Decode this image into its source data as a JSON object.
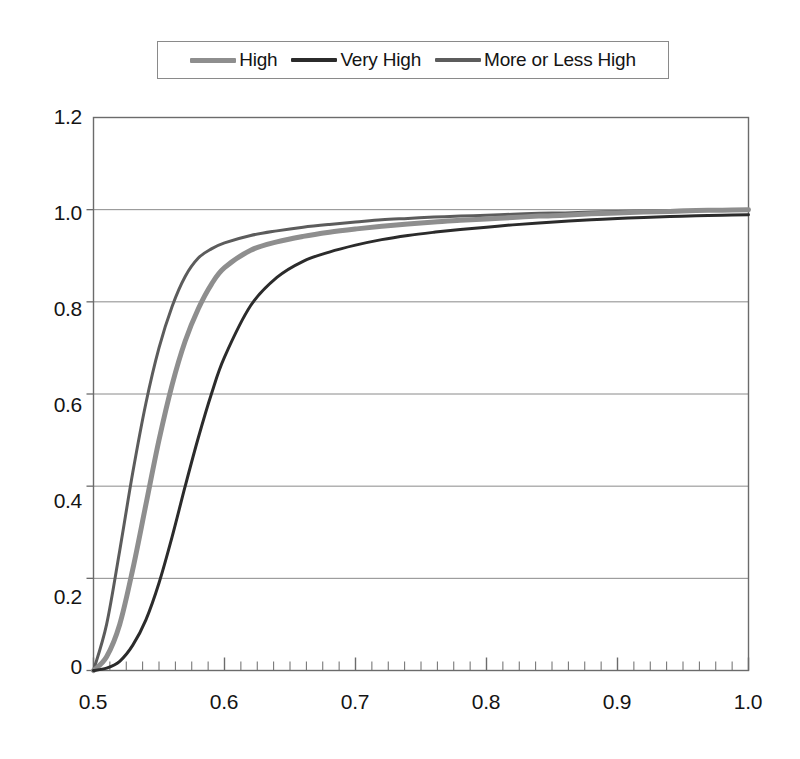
{
  "chart_data": {
    "type": "line",
    "title": "",
    "subtitle": "",
    "xlabel": "",
    "ylabel": "",
    "xlim": [
      0.5,
      1.0
    ],
    "ylim": [
      0,
      1.2
    ],
    "xticks": [
      "0.5",
      "0.6",
      "0.7",
      "0.8",
      "0.9",
      "1.0"
    ],
    "xtick_values": [
      0.5,
      0.6,
      0.7,
      0.8,
      0.9,
      1.0
    ],
    "yticks": [
      "0",
      "0.2",
      "0.4",
      "0.6",
      "0.8",
      "1.0",
      "1.2"
    ],
    "ytick_values": [
      0,
      0.2,
      0.4,
      0.6,
      0.8,
      1.0,
      1.2
    ],
    "grid": "horizontal",
    "x_minor_ticks": true,
    "x_minor_tick_step": 0.0125,
    "legend_position": "top-center",
    "legend_border": true,
    "x": [
      0.5,
      0.51,
      0.52,
      0.53,
      0.54,
      0.55,
      0.56,
      0.57,
      0.58,
      0.59,
      0.6,
      0.62,
      0.64,
      0.66,
      0.68,
      0.7,
      0.72,
      0.74,
      0.76,
      0.78,
      0.8,
      0.82,
      0.84,
      0.86,
      0.88,
      0.9,
      0.92,
      0.94,
      0.96,
      0.98,
      1.0
    ],
    "series": [
      {
        "name": "More or Less High",
        "color": "#5c5c5c",
        "line_width": 3,
        "values": [
          0.0,
          0.1,
          0.26,
          0.43,
          0.58,
          0.7,
          0.79,
          0.855,
          0.895,
          0.915,
          0.928,
          0.944,
          0.954,
          0.962,
          0.968,
          0.973,
          0.978,
          0.981,
          0.984,
          0.986,
          0.988,
          0.99,
          0.992,
          0.993,
          0.995,
          0.996,
          0.997,
          0.998,
          0.999,
          1.0,
          1.0
        ]
      },
      {
        "name": "High",
        "color": "#8e8e8e",
        "line_width": 5,
        "values": [
          0.0,
          0.03,
          0.1,
          0.22,
          0.36,
          0.5,
          0.62,
          0.715,
          0.785,
          0.838,
          0.874,
          0.912,
          0.93,
          0.942,
          0.951,
          0.958,
          0.964,
          0.969,
          0.973,
          0.977,
          0.98,
          0.983,
          0.986,
          0.988,
          0.991,
          0.993,
          0.995,
          0.996,
          0.998,
          0.999,
          1.0
        ]
      },
      {
        "name": "Very High",
        "color": "#2b2b2b",
        "line_width": 3,
        "values": [
          0.0,
          0.005,
          0.02,
          0.055,
          0.11,
          0.19,
          0.29,
          0.4,
          0.505,
          0.6,
          0.68,
          0.792,
          0.853,
          0.888,
          0.908,
          0.923,
          0.935,
          0.944,
          0.951,
          0.957,
          0.962,
          0.967,
          0.971,
          0.975,
          0.978,
          0.981,
          0.983,
          0.985,
          0.987,
          0.988,
          0.989
        ]
      }
    ]
  },
  "legend": {
    "entries": [
      {
        "label": "High",
        "swatch": "legend-line-high"
      },
      {
        "label": "Very High",
        "swatch": "legend-line-very-high"
      },
      {
        "label": "More or Less High",
        "swatch": "legend-line-more-or-less-high"
      }
    ]
  },
  "axes": {
    "y_labels": [
      "1.2",
      "1.0",
      "0.8",
      "0.6",
      "0.4",
      "0.2",
      "0"
    ],
    "x_labels": [
      "0.5",
      "0.6",
      "0.7",
      "0.8",
      "0.9",
      "1.0"
    ]
  },
  "colors": {
    "high": "#8e8e8e",
    "very_high": "#2b2b2b",
    "more_or_less_high": "#5c5c5c",
    "axis": "#6b6b6b",
    "grid": "#8a8a8a",
    "background": "#ffffff"
  }
}
